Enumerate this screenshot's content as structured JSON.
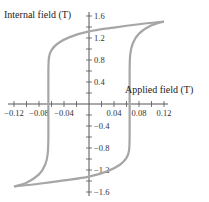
{
  "chart_data": {
    "type": "line",
    "title": "",
    "xlabel": "Applied field  (T)",
    "ylabel": "Internal field  (T)",
    "xlim": [
      -0.12,
      0.12
    ],
    "ylim": [
      -1.6,
      1.6
    ],
    "grid": false,
    "legend": "none",
    "x_ticks": [
      -0.12,
      -0.08,
      -0.04,
      0.04,
      0.08,
      0.12
    ],
    "x_tick_labels": [
      "−0.12",
      "−0.08",
      "−0.04",
      "0.04",
      "0.08",
      "0.12"
    ],
    "y_ticks": [
      1.6,
      1.2,
      0.8,
      0.4,
      -0.4,
      -0.8,
      -1.2,
      -1.6
    ],
    "y_tick_labels": [
      "1.6",
      "1.2",
      "0.8",
      "0.4",
      "−0.4",
      "−0.8",
      "−1.2",
      "−1.6"
    ],
    "curve_color": "#a6a6a6",
    "series": [
      {
        "name": "descending branch",
        "x": [
          0.12,
          0.08,
          0.04,
          0.0,
          -0.03,
          -0.05,
          -0.06,
          -0.064,
          -0.065,
          -0.065,
          -0.065,
          -0.066,
          -0.07,
          -0.08,
          -0.1,
          -0.12
        ],
        "y": [
          1.5,
          1.45,
          1.39,
          1.32,
          1.22,
          1.1,
          0.98,
          0.85,
          0.6,
          0.0,
          -0.6,
          -0.9,
          -1.1,
          -1.28,
          -1.43,
          -1.5
        ]
      },
      {
        "name": "ascending branch",
        "x": [
          -0.12,
          -0.08,
          -0.04,
          0.0,
          0.03,
          0.05,
          0.06,
          0.064,
          0.065,
          0.065,
          0.065,
          0.066,
          0.07,
          0.08,
          0.1,
          0.12
        ],
        "y": [
          -1.5,
          -1.45,
          -1.39,
          -1.32,
          -1.22,
          -1.1,
          -0.98,
          -0.85,
          -0.6,
          0.0,
          0.6,
          0.9,
          1.1,
          1.28,
          1.43,
          1.5
        ]
      }
    ]
  }
}
